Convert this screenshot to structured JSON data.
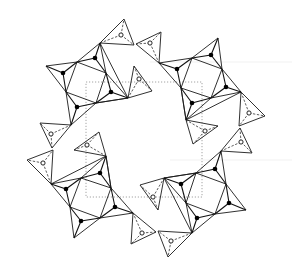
{
  "figure": {
    "kind": "crystal-structure-projection",
    "width": 292,
    "height": 277,
    "center": [
      146,
      138
    ],
    "symmetry": "4-fold rotation",
    "colors": {
      "background": "#ffffff",
      "lines": "#1a1a1a",
      "unit_cell": "#9a9a9a"
    },
    "unit_cell": {
      "x": 86,
      "y": 82,
      "w": 116,
      "h": 115,
      "style": "dotted"
    },
    "legend": []
  },
  "quadrant": {
    "solid_triangles": [
      [
        [
          46,
          66
        ],
        [
          77,
          62
        ],
        [
          63,
          73
        ]
      ],
      [
        [
          77,
          62
        ],
        [
          100,
          43
        ],
        [
          95,
          58
        ]
      ],
      [
        [
          95,
          58
        ],
        [
          106,
          73
        ],
        [
          77,
          62
        ]
      ],
      [
        [
          106,
          73
        ],
        [
          128,
          98
        ],
        [
          111,
          92
        ]
      ],
      [
        [
          111,
          92
        ],
        [
          110,
          104
        ],
        [
          96,
          103
        ]
      ],
      [
        [
          96,
          103
        ],
        [
          66,
          92
        ],
        [
          77,
          107
        ]
      ],
      [
        [
          66,
          92
        ],
        [
          46,
          66
        ],
        [
          63,
          73
        ]
      ],
      [
        [
          77,
          107
        ],
        [
          77,
          125
        ],
        [
          96,
          103
        ]
      ]
    ],
    "filled_centers": [
      {
        "c": [
          63,
          73
        ],
        "v": [
          [
            46,
            66
          ],
          [
            77,
            62
          ],
          [
            66,
            92
          ]
        ]
      },
      {
        "c": [
          95,
          58
        ],
        "v": [
          [
            77,
            62
          ],
          [
            100,
            43
          ],
          [
            106,
            73
          ]
        ]
      },
      {
        "c": [
          111,
          92
        ],
        "v": [
          [
            106,
            73
          ],
          [
            128,
            98
          ],
          [
            96,
            103
          ]
        ]
      },
      {
        "c": [
          77,
          107
        ],
        "v": [
          [
            66,
            92
          ],
          [
            96,
            103
          ],
          [
            71,
            125
          ]
        ]
      }
    ],
    "outer_edges": [
      [
        [
          46,
          66
        ],
        [
          77,
          62
        ]
      ],
      [
        [
          77,
          62
        ],
        [
          106,
          73
        ]
      ],
      [
        [
          106,
          73
        ],
        [
          100,
          43
        ]
      ],
      [
        [
          100,
          43
        ],
        [
          77,
          62
        ]
      ],
      [
        [
          106,
          73
        ],
        [
          128,
          98
        ]
      ],
      [
        [
          128,
          98
        ],
        [
          96,
          103
        ]
      ],
      [
        [
          96,
          103
        ],
        [
          106,
          73
        ]
      ],
      [
        [
          96,
          103
        ],
        [
          66,
          92
        ]
      ],
      [
        [
          66,
          92
        ],
        [
          46,
          66
        ]
      ],
      [
        [
          66,
          92
        ],
        [
          71,
          125
        ]
      ],
      [
        [
          71,
          125
        ],
        [
          96,
          103
        ]
      ],
      [
        [
          77,
          62
        ],
        [
          66,
          92
        ]
      ],
      [
        [
          100,
          43
        ],
        [
          128,
          98
        ]
      ],
      [
        [
          128,
          98
        ],
        [
          96,
          103
        ]
      ]
    ],
    "open_triangles": [
      {
        "v": [
          [
            100,
            43
          ],
          [
            124,
            19
          ],
          [
            134,
            45
          ]
        ],
        "c": [
          121,
          35
        ]
      },
      {
        "v": [
          [
            71,
            125
          ],
          [
            40,
            123
          ],
          [
            52,
            148
          ]
        ],
        "c": [
          51,
          134
        ]
      },
      {
        "v": [
          [
            128,
            98
          ],
          [
            134,
            66
          ],
          [
            152,
            91
          ]
        ],
        "c": [
          139,
          79
        ]
      }
    ]
  }
}
